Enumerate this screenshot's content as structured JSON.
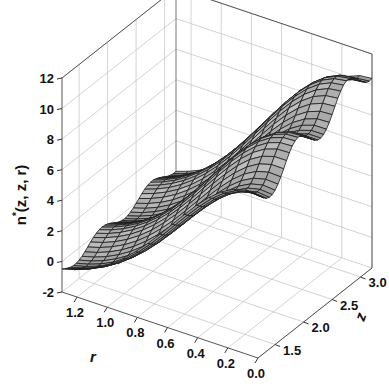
{
  "chart_data": {
    "type": "surface3d",
    "title": "",
    "zlabel": "n*(z, z, r)",
    "xlabel": "r",
    "ylabel": "z",
    "r_ticks": [
      "0.0",
      "0.2",
      "0.4",
      "0.6",
      "0.8",
      "1.0",
      "1.2"
    ],
    "z_ticks": [
      "1.5",
      "2.0",
      "2.5",
      "3.0"
    ],
    "value_ticks": [
      "-2",
      "0",
      "2",
      "4",
      "6",
      "8",
      "10",
      "12"
    ],
    "r_range": [
      0.0,
      1.3
    ],
    "z_range": [
      1.2,
      3.2
    ],
    "value_range": [
      -2,
      12
    ],
    "surface_color": "#a9a9a9",
    "mesh_color": "#1a1a1a",
    "grid_color": "#c8c8c8",
    "sample_profile_r0": {
      "z": [
        1.2,
        1.5,
        2.0,
        2.5,
        3.0,
        3.2
      ],
      "value": [
        7.5,
        8.0,
        9.5,
        10.2,
        11.5,
        11.5
      ]
    },
    "sample_profile_z_max": {
      "r": [
        0.0,
        0.4,
        0.8,
        1.2,
        1.3
      ],
      "value": [
        11.5,
        9.5,
        5.0,
        0.5,
        -0.5
      ]
    }
  },
  "labels": {
    "zlabel_main": "n",
    "zlabel_sup": "*",
    "zlabel_rest": "(z, z, r)",
    "xlabel": "r",
    "ylabel": "z"
  }
}
